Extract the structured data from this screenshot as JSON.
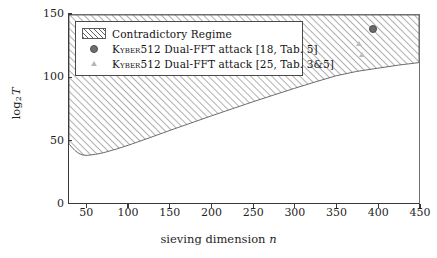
{
  "chart_data": {
    "type": "area",
    "title": "",
    "xlabel": "sieving dimension n",
    "ylabel": "log_2 T",
    "xlim": [
      28,
      450
    ],
    "ylim": [
      0,
      150
    ],
    "xticks": [
      50,
      100,
      150,
      200,
      250,
      300,
      350,
      400,
      450
    ],
    "yticks": [
      0,
      50,
      100,
      150
    ],
    "grid": false,
    "legend_position": "upper-left",
    "series": [
      {
        "name": "Contradictory Regime",
        "kind": "hatched-region",
        "hatch": "diagonal-45",
        "description": "Region between a lower boundary curve and the top of the axes (log2 T = 150)",
        "lower_boundary": {
          "x": [
            28,
            35,
            40,
            45,
            50,
            60,
            70,
            85,
            100,
            125,
            150,
            175,
            200,
            225,
            250,
            275,
            300,
            325,
            350,
            375,
            400,
            425,
            450
          ],
          "y": [
            47,
            42,
            39.5,
            38.2,
            38.0,
            38.8,
            40.2,
            43.0,
            46.2,
            52.0,
            58.0,
            63.8,
            69.6,
            75.2,
            80.8,
            86.2,
            91.5,
            96.6,
            101.5,
            105.0,
            107.5,
            110.0,
            112.0
          ]
        },
        "upper_boundary_constant": 150
      },
      {
        "name": "Kyber512 Dual-FFT attack [18, Tab. 5]",
        "kind": "scatter",
        "marker": "circle",
        "color": "#6a6a6a",
        "points": [
          {
            "x": 391,
            "y": 140
          }
        ]
      },
      {
        "name": "Kyber512 Dual-FFT attack [25, Tab. 3&5]",
        "kind": "scatter",
        "marker": "triangle",
        "color": "#bcbcbc",
        "points": [
          {
            "x": 376,
            "y": 127
          },
          {
            "x": 379,
            "y": 119
          }
        ]
      }
    ],
    "legend_entries": [
      {
        "label": "Contradictory Regime",
        "marker": "hatch"
      },
      {
        "label_smallcaps": "Kyber",
        "label": "512 Dual-FFT attack [18, Tab. 5]",
        "marker": "circle"
      },
      {
        "label_smallcaps": "Kyber",
        "label": "512 Dual-FFT attack [25, Tab. 3&5]",
        "marker": "triangle"
      }
    ]
  },
  "axes": {
    "xlabel_prefix": "sieving dimension ",
    "xlabel_var": "n",
    "ylabel_main": "log",
    "ylabel_sub": "2",
    "ylabel_var": "T",
    "xticklabels": [
      "50",
      "100",
      "150",
      "200",
      "250",
      "300",
      "350",
      "400",
      "450"
    ],
    "yticklabels": [
      "0",
      "50",
      "100",
      "150"
    ]
  },
  "colors": {
    "hatch": "#5f5f5f",
    "frame": "#3a3a3a",
    "point_dark": "#6a6a6a",
    "point_light": "#bcbcbc",
    "background": "#ffffff"
  }
}
